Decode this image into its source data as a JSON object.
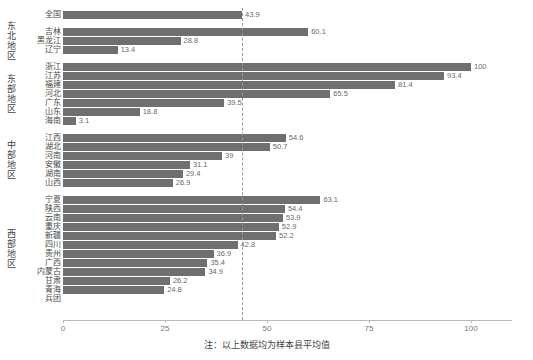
{
  "chart_data": {
    "type": "bar",
    "orientation": "horizontal",
    "title": "",
    "xlabel": "",
    "ylabel": "",
    "xlim": [
      0,
      110
    ],
    "xticks": [
      0,
      25,
      50,
      75,
      100
    ],
    "xtick_labels": [
      "0",
      "25",
      "50",
      "75",
      "100"
    ],
    "grid": false,
    "bar_color": "#6f6f6f",
    "reference_line": {
      "value": 43.9,
      "style": "dashed",
      "color": "#9a9a9a",
      "label": ""
    },
    "groups": [
      {
        "name": "",
        "categories": [
          "全国"
        ],
        "values": [
          43.9
        ]
      },
      {
        "name": "东北地区",
        "categories": [
          "吉林",
          "黑龙江",
          "辽宁"
        ],
        "values": [
          60.1,
          28.8,
          13.4
        ]
      },
      {
        "name": "东部地区",
        "categories": [
          "浙江",
          "江苏",
          "福建",
          "河北",
          "广东",
          "山东",
          "海南"
        ],
        "values": [
          100,
          93.4,
          81.4,
          65.5,
          39.5,
          18.8,
          3.1
        ]
      },
      {
        "name": "中部地区",
        "categories": [
          "江西",
          "湖北",
          "河南",
          "安徽",
          "湖南",
          "山西"
        ],
        "values": [
          54.6,
          50.7,
          39,
          31.1,
          29.4,
          26.9
        ]
      },
      {
        "name": "西部地区",
        "categories": [
          "宁夏",
          "陕西",
          "云南",
          "重庆",
          "新疆",
          "四川",
          "贵州",
          "广西",
          "内蒙古",
          "甘肃",
          "青海",
          "兵团"
        ],
        "values": [
          63.1,
          54.4,
          53.9,
          52.9,
          52.2,
          42.8,
          36.9,
          35.4,
          34.9,
          26.2,
          24.8,
          0
        ]
      }
    ],
    "value_labels": [
      "43.9",
      "60.1",
      "28.8",
      "13.4",
      "100",
      "93.4",
      "81.4",
      "65.5",
      "39.5",
      "18.8",
      "3.1",
      "54.6",
      "50.7",
      "39",
      "31.1",
      "29.4",
      "26.9",
      "63.1",
      "54.4",
      "53.9",
      "52.9",
      "52.2",
      "42.8",
      "36.9",
      "35.4",
      "34.9",
      "26.2",
      "24.8",
      ""
    ]
  },
  "footnote": "注：以上数据均为样本县平均值"
}
